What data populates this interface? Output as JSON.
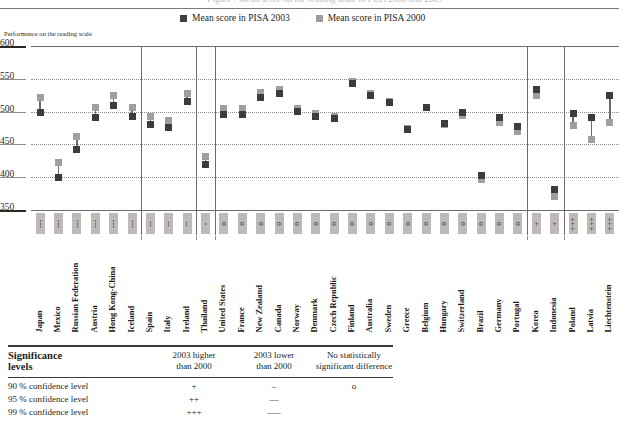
{
  "figure": {
    "title": "Figure : Mean score on the reading scale in PISA 2000 and 2003",
    "axis_caption": "Performance on the reading scale",
    "legend": [
      {
        "label": "Mean score in PISA 2003",
        "color": "#3f3f3f",
        "icon": "square-swatch-dark"
      },
      {
        "label": "Mean score in PISA 2000",
        "color": "#9d9d9d",
        "icon": "square-swatch-light"
      }
    ]
  },
  "chart_data": {
    "type": "scatter",
    "title": "Mean score on the reading scale in PISA 2000 and 2003",
    "xlabel": "",
    "ylabel": "Performance on the reading scale",
    "ylim": [
      350,
      600
    ],
    "yticks": [
      600,
      550,
      500,
      450,
      400,
      350
    ],
    "grid": true,
    "legend_position": "top",
    "categories": [
      "Japan",
      "Mexico",
      "Russian Federation",
      "Austria",
      "Hong Kong-China",
      "Iceland",
      "Spain",
      "Italy",
      "Ireland",
      "Thailand",
      "United States",
      "France",
      "New Zealand",
      "Canada",
      "Norway",
      "Denmark",
      "Czech Republic",
      "Finland",
      "Australia",
      "Sweden",
      "Greece",
      "Belgium",
      "Hungary",
      "Switzerland",
      "Brazil",
      "Germany",
      "Portugal",
      "Korea",
      "Indonesia",
      "Poland",
      "Latvia",
      "Liechtenstein"
    ],
    "series": [
      {
        "name": "Mean score in PISA 2003",
        "color": "#3c3c3c",
        "values": [
          498,
          400,
          442,
          491,
          510,
          492,
          481,
          476,
          515,
          420,
          495,
          496,
          522,
          528,
          500,
          492,
          489,
          543,
          525,
          514,
          472,
          507,
          482,
          499,
          403,
          491,
          478,
          534,
          382,
          497,
          491,
          525
        ]
      },
      {
        "name": "Mean score in PISA 2000",
        "color": "#9f9f9f",
        "values": [
          522,
          422,
          462,
          507,
          525,
          507,
          493,
          487,
          527,
          431,
          504,
          505,
          529,
          534,
          505,
          497,
          492,
          546,
          528,
          516,
          474,
          507,
          480,
          494,
          396,
          484,
          470,
          525,
          371,
          479,
          458,
          483
        ]
      }
    ],
    "significance": {
      "markers": [
        "---",
        "---",
        "---",
        "---",
        "---",
        "---",
        "--",
        "--",
        "--",
        "-",
        "o",
        "o",
        "o",
        "o",
        "o",
        "o",
        "o",
        "o",
        "o",
        "o",
        "o",
        "o",
        "o",
        "o",
        "o",
        "o",
        "o",
        "+",
        "+",
        "+++",
        "+++",
        "+++"
      ],
      "groups": [
        {
          "label": "99% lower",
          "from": "Japan",
          "to": "Iceland"
        },
        {
          "label": "95% lower",
          "from": "Spain",
          "to": "Ireland"
        },
        {
          "label": "90% lower",
          "from": "Thailand",
          "to": "Thailand"
        },
        {
          "label": "no difference",
          "from": "United States",
          "to": "Portugal"
        },
        {
          "label": "90% higher",
          "from": "Korea",
          "to": "Indonesia"
        },
        {
          "label": "99% higher",
          "from": "Poland",
          "to": "Liechtenstein"
        }
      ]
    }
  },
  "significance_table": {
    "title_line1": "Significance",
    "title_line2": "levels",
    "columns": [
      {
        "line1": "2003 higher",
        "line2": "than 2000"
      },
      {
        "line1": "2003 lower",
        "line2": "than 2000"
      },
      {
        "line1": "No statistically",
        "line2": "significant difference"
      }
    ],
    "rows": [
      {
        "label": "90 % confidence level",
        "higher": "+",
        "lower": "–",
        "none": "o"
      },
      {
        "label": "95 % confidence level",
        "higher": "++",
        "lower": "––",
        "none": ""
      },
      {
        "label": "99 % confidence level",
        "higher": "+++",
        "lower": "–––",
        "none": ""
      }
    ]
  }
}
